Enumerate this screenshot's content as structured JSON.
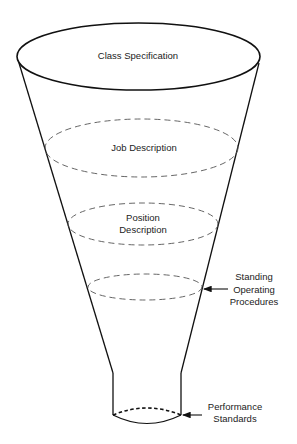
{
  "diagram": {
    "type": "funnel",
    "colors": {
      "stroke": "#111111",
      "dashed": "#555555",
      "text": "#222222",
      "background": "#ffffff"
    },
    "levels": [
      {
        "id": "class-specification",
        "lines": [
          "Class Specification"
        ]
      },
      {
        "id": "job-description",
        "lines": [
          "Job Description"
        ]
      },
      {
        "id": "position-description",
        "lines": [
          "Position",
          "Description"
        ]
      },
      {
        "id": "standing-operating-procedures",
        "lines": [
          "Standing",
          "Operating",
          "Procedures"
        ]
      },
      {
        "id": "performance-standards",
        "lines": [
          "Performance",
          "Standards"
        ]
      }
    ]
  }
}
